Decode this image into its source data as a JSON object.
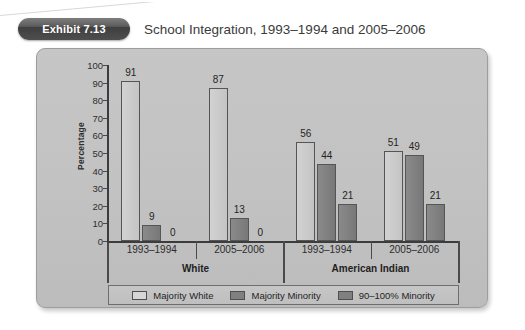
{
  "header": {
    "badge_label": "Exhibit 7.13",
    "title": "School Integration, 1993–1994 and 2005–2006"
  },
  "chart_data": {
    "type": "bar",
    "title": "School Integration, 1993–1994 and 2005–2006",
    "xlabel": "",
    "ylabel": "Percentage",
    "ylim": [
      0,
      100
    ],
    "ytick_step": 10,
    "yticks": [
      100,
      90,
      80,
      70,
      60,
      50,
      40,
      30,
      20,
      10,
      0
    ],
    "grid": false,
    "legend_position": "bottom",
    "groups": [
      "White",
      "American Indian"
    ],
    "categories": [
      "1993–1994",
      "2005–2006",
      "1993–1994",
      "2005–2006"
    ],
    "category_groups": [
      "White",
      "White",
      "American Indian",
      "American Indian"
    ],
    "series": [
      {
        "name": "Majority White",
        "color": "#cbcbcb",
        "values": [
          91,
          87,
          56,
          51
        ]
      },
      {
        "name": "Majority Minority",
        "color": "#7e7e7e",
        "values": [
          9,
          13,
          44,
          49
        ]
      },
      {
        "name": "90–100% Minority",
        "color": "#7e7e7e",
        "values": [
          0,
          0,
          21,
          21
        ]
      }
    ],
    "data_labels": [
      [
        "91",
        "87",
        "56",
        "51"
      ],
      [
        "9",
        "13",
        "44",
        "49"
      ],
      [
        "0",
        "0",
        "21",
        "21"
      ]
    ]
  },
  "axis": {
    "y_title": "Percentage"
  },
  "legend": {
    "items": [
      {
        "label": "Majority White"
      },
      {
        "label": "Majority Minority"
      },
      {
        "label": "90–100% Minority"
      }
    ]
  },
  "colors": {
    "panel_bg": "#c2c2c2",
    "axis": "#3c3c3c",
    "series_light": "#cbcbcb",
    "series_dark": "#7e7e7e",
    "badge_bg": "#4e4e4e",
    "text": "#2c2c2c"
  }
}
